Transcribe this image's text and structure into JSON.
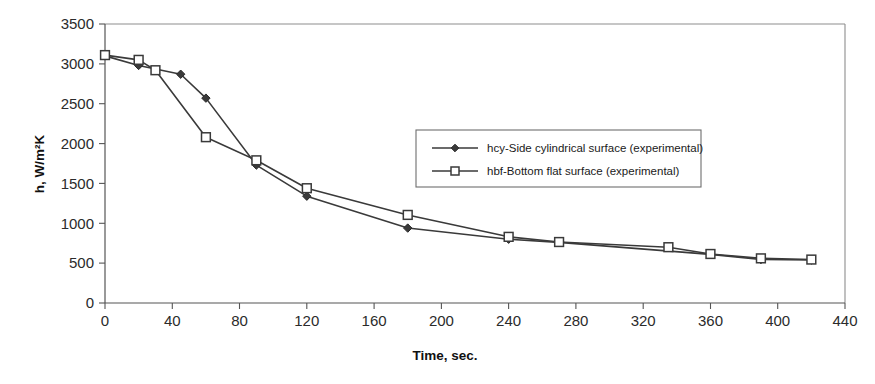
{
  "chart_data": {
    "type": "line",
    "title": "",
    "xlabel": "Time, sec.",
    "ylabel": "h, W/m²K",
    "xlim": [
      0,
      440
    ],
    "ylim": [
      0,
      3500
    ],
    "xticks": [
      0,
      40,
      80,
      120,
      160,
      200,
      240,
      280,
      320,
      360,
      400,
      440
    ],
    "yticks": [
      0,
      500,
      1000,
      1500,
      2000,
      2500,
      3000,
      3500
    ],
    "grid": false,
    "legend_position": "inside-upper-right",
    "series": [
      {
        "name": "hcy-Side cylindrical surface (experimental)",
        "marker": "filled-diamond",
        "x": [
          0,
          20,
          45,
          60,
          90,
          120,
          180,
          240,
          270,
          360,
          390,
          420
        ],
        "y": [
          3100,
          2980,
          2870,
          2570,
          1730,
          1340,
          940,
          800,
          760,
          610,
          545,
          540
        ]
      },
      {
        "name": "hbf-Bottom flat surface (experimental)",
        "marker": "open-square",
        "x": [
          0,
          20,
          30,
          60,
          90,
          120,
          180,
          240,
          270,
          335,
          360,
          390,
          420
        ],
        "y": [
          3110,
          3050,
          2920,
          2080,
          1790,
          1440,
          1105,
          830,
          765,
          700,
          615,
          560,
          545
        ]
      }
    ]
  },
  "axes": {
    "y_axis_title": "h, W/m²K",
    "x_axis_title": "Time, sec.",
    "y_tick_labels": [
      "0",
      "500",
      "1000",
      "1500",
      "2000",
      "2500",
      "3000",
      "3500"
    ],
    "x_tick_labels": [
      "0",
      "40",
      "80",
      "120",
      "160",
      "200",
      "240",
      "280",
      "320",
      "360",
      "400",
      "440"
    ]
  },
  "legend": {
    "entries": [
      {
        "label": "hcy-Side cylindrical surface (experimental)",
        "marker": "filled-diamond"
      },
      {
        "label": "hbf-Bottom flat surface (experimental)",
        "marker": "open-square"
      }
    ]
  },
  "colors": {
    "line": "#3a3a3a",
    "axis": "#555555",
    "frame": "#8d8d8d",
    "text": "#1a1a1a",
    "background": "#ffffff"
  }
}
